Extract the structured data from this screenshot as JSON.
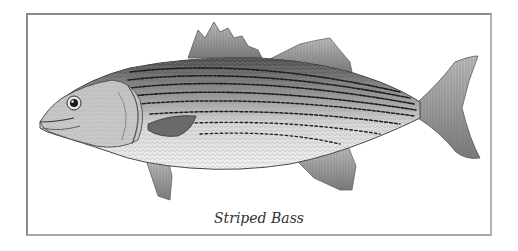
{
  "figure": {
    "caption": "Striped Bass",
    "colors": {
      "border": "#8a8a8a",
      "background": "#ffffff",
      "caption_text": "#333333"
    }
  }
}
